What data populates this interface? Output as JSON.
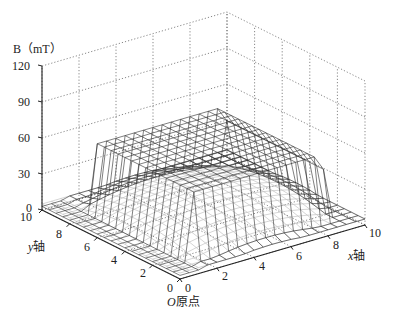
{
  "chart_data": {
    "type": "surface3d",
    "title": "",
    "zlabel": "B（mT）",
    "xlabel": "x轴",
    "ylabel": "y轴",
    "origin_label": "O原点",
    "xlim": [
      0,
      10
    ],
    "ylim": [
      0,
      10
    ],
    "zlim": [
      0,
      120
    ],
    "x_ticks": [
      0,
      2,
      4,
      6,
      8,
      10
    ],
    "y_ticks": [
      0,
      2,
      4,
      6,
      8,
      10
    ],
    "z_ticks": [
      0,
      30,
      90,
      60,
      120
    ],
    "z_tick_values": [
      0,
      30,
      60,
      90,
      120
    ],
    "grid": true,
    "series": [
      {
        "name": "Measured B surface (plateau)",
        "style": "dark mesh",
        "description": "Flat plateau about 60 mT over the central region (x≈1.5–8.5, y≈1–8), dropping steeply to near 0 at the edges; near-zero flat region for x<1.5",
        "plateau_level_mT": 60,
        "edge_level_mT": 3
      },
      {
        "name": "Model B surface (dome)",
        "style": "light gray mesh",
        "description": "Smooth dome peaking near 20 mT at the center, falling to ~5 mT at the edges",
        "peak_level_mT": 20,
        "edge_level_mT": 5
      }
    ]
  },
  "labels": {
    "zlabel": "B（mT）",
    "z_ticks": [
      "120",
      "90",
      "60",
      "30",
      "0"
    ],
    "y_ticks": [
      "10",
      "8",
      "6",
      "4",
      "2",
      "0"
    ],
    "x_ticks": [
      "0",
      "2",
      "4",
      "6",
      "8",
      "10"
    ],
    "ylabel_var": "y",
    "ylabel_suffix": "轴",
    "xlabel_var": "x",
    "xlabel_suffix": "轴",
    "origin_var": "O",
    "origin_suffix": "原点"
  },
  "colors": {
    "axis": "#222222",
    "grid": "#555555",
    "mesh_dark": "#2a2a2a",
    "mesh_light": "#b8b8b8"
  }
}
